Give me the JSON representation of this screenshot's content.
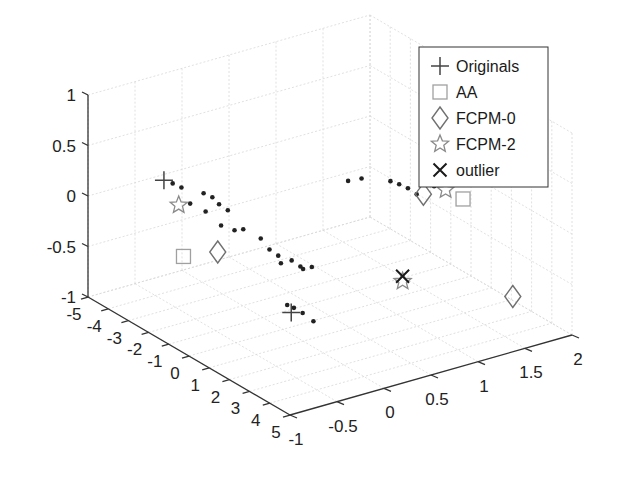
{
  "chart_data": {
    "type": "scatter",
    "dimensions": 3,
    "title": "",
    "xlabel": "",
    "ylabel": "",
    "zlabel": "",
    "xlim": [
      -5,
      5
    ],
    "ylim": [
      -1,
      2
    ],
    "zlim": [
      -1,
      1
    ],
    "grid": true,
    "legend_position": "top-right",
    "x_ticks": [
      "-5",
      "-4",
      "-3",
      "-2",
      "-1",
      "0",
      "1",
      "2",
      "3",
      "4",
      "5"
    ],
    "y_ticks": [
      "-1",
      "-0.5",
      "0",
      "0.5",
      "1",
      "1.5",
      "2"
    ],
    "z_ticks": [
      "-1",
      "-0.5",
      "0",
      "0.5",
      "1"
    ],
    "x_tick_values": [
      -5,
      -4,
      -3,
      -2,
      -1,
      0,
      1,
      2,
      3,
      4,
      5
    ],
    "y_tick_values": [
      -1,
      -0.5,
      0,
      0.5,
      1,
      1.5,
      2
    ],
    "z_tick_values": [
      -1,
      -0.5,
      0,
      0.5,
      1
    ],
    "series": [
      {
        "name": "data",
        "marker": "dot",
        "color": "#222222",
        "show_in_legend": false,
        "points": [
          [
            -3.6,
            -0.4,
            0.13
          ],
          [
            -3.4,
            -0.35,
            0.1
          ],
          [
            -3.0,
            -0.2,
            0.05
          ],
          [
            -2.8,
            -0.15,
            0.02
          ],
          [
            -3.2,
            -0.3,
            -0.05
          ],
          [
            -2.9,
            -0.2,
            -0.12
          ],
          [
            -2.7,
            -0.1,
            -0.05
          ],
          [
            -2.5,
            -0.05,
            -0.1
          ],
          [
            -2.6,
            -0.1,
            -0.25
          ],
          [
            -2.4,
            0.0,
            -0.3
          ],
          [
            -2.2,
            0.05,
            -0.28
          ],
          [
            -1.8,
            0.15,
            -0.35
          ],
          [
            -1.6,
            0.2,
            -0.45
          ],
          [
            -1.4,
            0.25,
            -0.5
          ],
          [
            -1.5,
            0.3,
            -0.6
          ],
          [
            -1.2,
            0.35,
            -0.55
          ],
          [
            -1.0,
            0.4,
            -0.6
          ],
          [
            -1.1,
            0.45,
            -0.65
          ],
          [
            -0.9,
            0.5,
            -0.62
          ],
          [
            3.0,
            -0.6,
            -0.25
          ],
          [
            3.1,
            -0.55,
            -0.28
          ],
          [
            3.3,
            -0.5,
            -0.32
          ],
          [
            3.6,
            -0.45,
            -0.38
          ],
          [
            -0.5,
            0.8,
            0.2
          ],
          [
            -0.3,
            0.9,
            0.22
          ],
          [
            0.2,
            1.1,
            0.2
          ],
          [
            0.4,
            1.15,
            0.18
          ],
          [
            0.6,
            1.2,
            0.15
          ],
          [
            0.8,
            1.25,
            0.1
          ],
          [
            1.2,
            1.35,
            0.2
          ],
          [
            1.6,
            1.5,
            0.35
          ],
          [
            1.9,
            1.6,
            0.3
          ]
        ]
      },
      {
        "name": "Originals",
        "marker": "plus",
        "color": "#444444",
        "points": [
          [
            -3.8,
            -0.45,
            0.15
          ],
          [
            3.2,
            -0.6,
            -0.3
          ],
          [
            2.0,
            1.65,
            0.33
          ]
        ]
      },
      {
        "name": "AA",
        "marker": "square",
        "color": "#a0a0a0",
        "points": [
          [
            -2.6,
            -0.5,
            -0.45
          ],
          [
            1.7,
            1.55,
            0.08
          ]
        ]
      },
      {
        "name": "FCPM-0",
        "marker": "diamond",
        "color": "#707070",
        "points": [
          [
            -2.3,
            -0.2,
            -0.45
          ],
          [
            0.9,
            1.3,
            0.1
          ],
          [
            3.0,
            1.8,
            -0.8
          ]
        ]
      },
      {
        "name": "FCPM-2",
        "marker": "star",
        "color": "#8a8a8a",
        "points": [
          [
            -3.3,
            -0.4,
            -0.05
          ],
          [
            1.3,
            1.45,
            0.15
          ],
          [
            1.5,
            0.95,
            -0.6
          ]
        ]
      },
      {
        "name": "outlier",
        "marker": "x",
        "color": "#1a1a1a",
        "points": [
          [
            1.5,
            0.95,
            -0.55
          ]
        ]
      }
    ]
  },
  "legend": {
    "items": [
      {
        "label": "Originals",
        "marker": "plus",
        "color": "#444444"
      },
      {
        "label": "AA",
        "marker": "square",
        "color": "#a0a0a0"
      },
      {
        "label": "FCPM-0",
        "marker": "diamond",
        "color": "#707070"
      },
      {
        "label": "FCPM-2",
        "marker": "star",
        "color": "#8a8a8a"
      },
      {
        "label": "outlier",
        "marker": "x",
        "color": "#1a1a1a"
      }
    ]
  }
}
